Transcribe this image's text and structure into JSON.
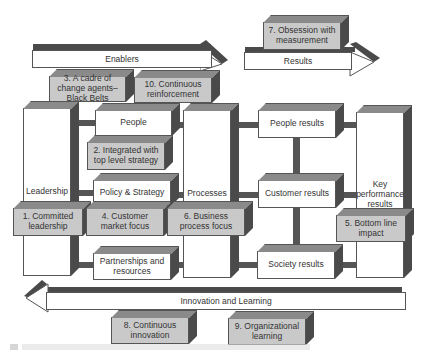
{
  "diagram": {
    "arrows": {
      "enablers": "Enablers",
      "results": "Results",
      "innovation": "Innovation and Learning"
    },
    "columns": {
      "leadership": "Leadership",
      "people": "People",
      "policy_strategy": "Policy & Strategy",
      "partnerships": "Partnerships and resources",
      "processes": "Processes",
      "people_results": "People results",
      "customer_results": "Customer results",
      "society_results": "Society results",
      "key_performance": "Key performance results"
    },
    "factors": [
      {
        "id": 1,
        "label": "1. Committed leadership"
      },
      {
        "id": 2,
        "label": "2. Integrated with top level strategy"
      },
      {
        "id": 3,
        "label": "3. A cadre of change agents–Black Belts"
      },
      {
        "id": 4,
        "label": "4. Customer market focus"
      },
      {
        "id": 5,
        "label": "5. Bottom line impact"
      },
      {
        "id": 6,
        "label": "6. Business process focus"
      },
      {
        "id": 7,
        "label": "7. Obsession with measurement"
      },
      {
        "id": 8,
        "label": "8. Continuous innovation"
      },
      {
        "id": 9,
        "label": "9. Organizational learning"
      },
      {
        "id": 10,
        "label": "10. Continuous reinforcement"
      }
    ]
  }
}
